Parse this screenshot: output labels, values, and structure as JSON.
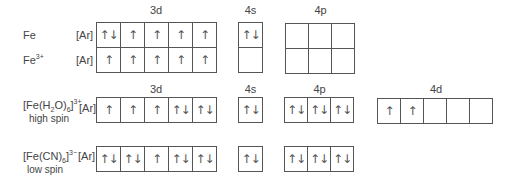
{
  "headers": {
    "top": {
      "d3": "3d",
      "s4": "4s",
      "p4": "4p"
    },
    "bottom": {
      "d3": "3d",
      "s4": "4s",
      "p4": "4p",
      "d4": "4d"
    }
  },
  "core": "[Ar]",
  "rows": [
    {
      "label": "Fe",
      "sup": "",
      "d3": [
        "↑↓",
        "↑",
        "↑",
        "↑",
        "↑"
      ],
      "s4": [
        "↑↓"
      ],
      "p4": [
        "",
        "",
        ""
      ]
    },
    {
      "label": "Fe",
      "sup": "3+",
      "d3": [
        "↑",
        "↑",
        "↑",
        "↑",
        "↑"
      ],
      "s4": [
        ""
      ],
      "p4": [
        "",
        "",
        ""
      ]
    },
    {
      "label_pre": "[Fe(H",
      "sub1": "2",
      "label_mid": "O)",
      "sub2": "6",
      "label_post": "]",
      "sup": "3+",
      "spin": "high spin",
      "d3": [
        "↑",
        "↑",
        "↑",
        "↑↓",
        "↑↓"
      ],
      "s4": [
        "↑↓"
      ],
      "p4": [
        "↑↓",
        "↑↓",
        "↑↓"
      ],
      "d4": [
        "↑",
        "↑",
        "",
        "",
        ""
      ]
    },
    {
      "label_pre": "[Fe(CN)",
      "sub2": "6",
      "label_post": "]",
      "sup": "3−",
      "spin": "low spin",
      "d3": [
        "↑↓",
        "↑↓",
        "↑",
        "↑↓",
        "↑↓"
      ],
      "s4": [
        "↑↓"
      ],
      "p4": [
        "↑↓",
        "↑↓",
        "↑↓"
      ]
    }
  ]
}
